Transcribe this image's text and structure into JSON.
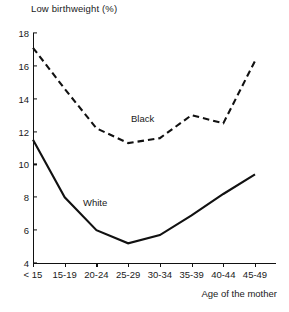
{
  "chart_data": {
    "type": "line",
    "title": "Low birthweight (%)",
    "xlabel": "Age of the mother",
    "ylabel": "",
    "categories": [
      "< 15",
      "15-19",
      "20-24",
      "25-29",
      "30-34",
      "35-39",
      "40-44",
      "45-49"
    ],
    "ylim": [
      4,
      18
    ],
    "yticks": [
      4,
      6,
      8,
      10,
      12,
      14,
      16,
      18
    ],
    "grid": false,
    "legend_position": "inline-annotation",
    "series": [
      {
        "name": "Black",
        "style": "dashed",
        "color": "#111111",
        "values": [
          17.1,
          14.6,
          12.2,
          11.3,
          11.6,
          13.0,
          12.5,
          16.3
        ]
      },
      {
        "name": "White",
        "style": "solid",
        "color": "#111111",
        "values": [
          11.5,
          8.0,
          6.0,
          5.2,
          5.7,
          6.9,
          8.2,
          9.4
        ]
      }
    ],
    "annotations": [
      {
        "text": "Black",
        "series": "Black"
      },
      {
        "text": "White",
        "series": "White"
      }
    ]
  }
}
